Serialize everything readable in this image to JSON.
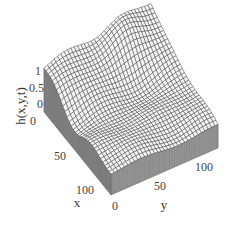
{
  "chart_data": {
    "type": "surface3d",
    "title": "",
    "zlabel": "h(x,y,t)",
    "xlabel": "x",
    "ylabel": "y",
    "x_ticks": [
      "0",
      "50",
      "100"
    ],
    "y_ticks": [
      "0",
      "50",
      "100"
    ],
    "z_ticks": [
      "0",
      "0.5",
      "1"
    ],
    "x_range": [
      0,
      128
    ],
    "y_range": [
      0,
      128
    ],
    "z_range": [
      0,
      1.2
    ],
    "grid_resolution": 32,
    "colors": {
      "mesh": "#333333",
      "surface_fill": "#f4f4f4",
      "side_fill": "#8a8a8a"
    }
  }
}
